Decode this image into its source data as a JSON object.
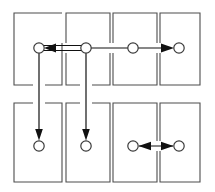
{
  "figure": {
    "title": "",
    "type": "grid-flow-diagram",
    "canvas": {
      "width": 215,
      "height": 192,
      "background": "#ffffff"
    },
    "style": {
      "cell_stroke": "#4d4d4d",
      "node_stroke": "#3a3a3a",
      "node_fill": "#ffffff",
      "edge_color": "#111111"
    }
  },
  "grid": {
    "columns": 4,
    "rows": 2,
    "cells": [
      {
        "id": "cell-r1c1",
        "name": "cell-row1-col1",
        "x": 14,
        "y": 13,
        "w": 48,
        "h": 72
      },
      {
        "id": "cell-r1c2",
        "name": "cell-row1-col2",
        "x": 66,
        "y": 13,
        "w": 44,
        "h": 72
      },
      {
        "id": "cell-r1c3",
        "name": "cell-row1-col3",
        "x": 113,
        "y": 13,
        "w": 44,
        "h": 72
      },
      {
        "id": "cell-r1c4",
        "name": "cell-row1-col4",
        "x": 160,
        "y": 13,
        "w": 40,
        "h": 72
      },
      {
        "id": "cell-r2c1",
        "name": "cell-row2-col1",
        "x": 14,
        "y": 103,
        "w": 48,
        "h": 79
      },
      {
        "id": "cell-r2c2",
        "name": "cell-row2-col2",
        "x": 66,
        "y": 103,
        "w": 44,
        "h": 79
      },
      {
        "id": "cell-r2c3",
        "name": "cell-row2-col3",
        "x": 113,
        "y": 103,
        "w": 44,
        "h": 79
      },
      {
        "id": "cell-r2c4",
        "name": "cell-row2-col4",
        "x": 160,
        "y": 103,
        "w": 40,
        "h": 79
      }
    ]
  },
  "nodes": [
    {
      "id": "n1",
      "name": "node-row1-col1",
      "cell": "cell-r1c1",
      "cx": 39,
      "cy": 48,
      "r": 5.2,
      "label": ""
    },
    {
      "id": "n2",
      "name": "node-row1-col2",
      "cell": "cell-r1c2",
      "cx": 86,
      "cy": 48,
      "r": 5.2,
      "label": ""
    },
    {
      "id": "n3",
      "name": "node-row1-col3",
      "cell": "cell-r1c3",
      "cx": 133,
      "cy": 48,
      "r": 5.2,
      "label": ""
    },
    {
      "id": "n4",
      "name": "node-row1-col4",
      "cell": "cell-r1c4",
      "cx": 179,
      "cy": 48,
      "r": 5.2,
      "label": ""
    },
    {
      "id": "n5",
      "name": "node-row2-col1",
      "cell": "cell-r2c1",
      "cx": 39,
      "cy": 146,
      "r": 5.2,
      "label": ""
    },
    {
      "id": "n6",
      "name": "node-row2-col2",
      "cell": "cell-r2c2",
      "cx": 86,
      "cy": 146,
      "r": 5.2,
      "label": ""
    },
    {
      "id": "n7",
      "name": "node-row2-col3",
      "cell": "cell-r2c3",
      "cx": 133,
      "cy": 146,
      "r": 5.2,
      "label": ""
    },
    {
      "id": "n8",
      "name": "node-row2-col4",
      "cell": "cell-r2c4",
      "cx": 179,
      "cy": 146,
      "r": 5.2,
      "label": ""
    }
  ],
  "edges": [
    {
      "id": "e1",
      "name": "edge-node2-to-node1",
      "from": "n2",
      "to": "n1",
      "direction": "left",
      "kind": "horizontal-double-rail",
      "label": ""
    },
    {
      "id": "e2",
      "name": "edge-node3-to-node4",
      "from": "n3",
      "to": "n4",
      "direction": "right",
      "kind": "horizontal",
      "label": ""
    },
    {
      "id": "e3",
      "name": "edge-node1-to-node5",
      "from": "n1",
      "to": "n5",
      "direction": "down",
      "kind": "vertical",
      "label": ""
    },
    {
      "id": "e4",
      "name": "edge-node2-to-node6",
      "from": "n2",
      "to": "n6",
      "direction": "down",
      "kind": "vertical",
      "label": ""
    },
    {
      "id": "e5",
      "name": "edge-node7-node8-bidirectional",
      "from": "n7",
      "to": "n8",
      "direction": "both",
      "kind": "horizontal-bidirectional",
      "label": ""
    }
  ]
}
